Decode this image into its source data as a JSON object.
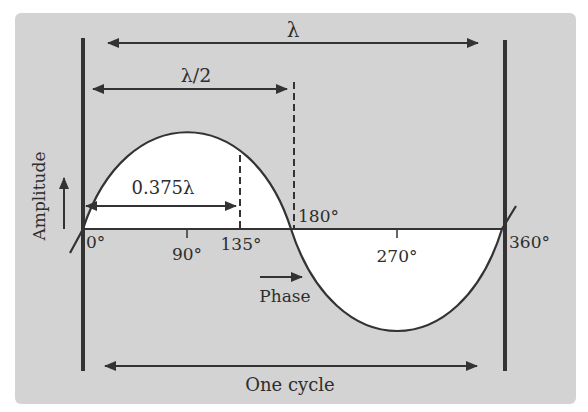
{
  "diagram": {
    "type": "sine-wave-wavelength",
    "background_color": "#d3d3d3",
    "stroke_color": "#333333",
    "labels": {
      "wavelength": "λ",
      "half_wavelength": "λ/2",
      "fraction_wavelength": "0.375λ",
      "y_axis": "Amplitude",
      "x_axis": "Phase",
      "cycle": "One cycle"
    },
    "phase_ticks": [
      {
        "label": "0°",
        "degrees": 0
      },
      {
        "label": "90°",
        "degrees": 90
      },
      {
        "label": "135°",
        "degrees": 135
      },
      {
        "label": "180°",
        "degrees": 180
      },
      {
        "label": "270°",
        "degrees": 270
      },
      {
        "label": "360°",
        "degrees": 360
      }
    ]
  }
}
